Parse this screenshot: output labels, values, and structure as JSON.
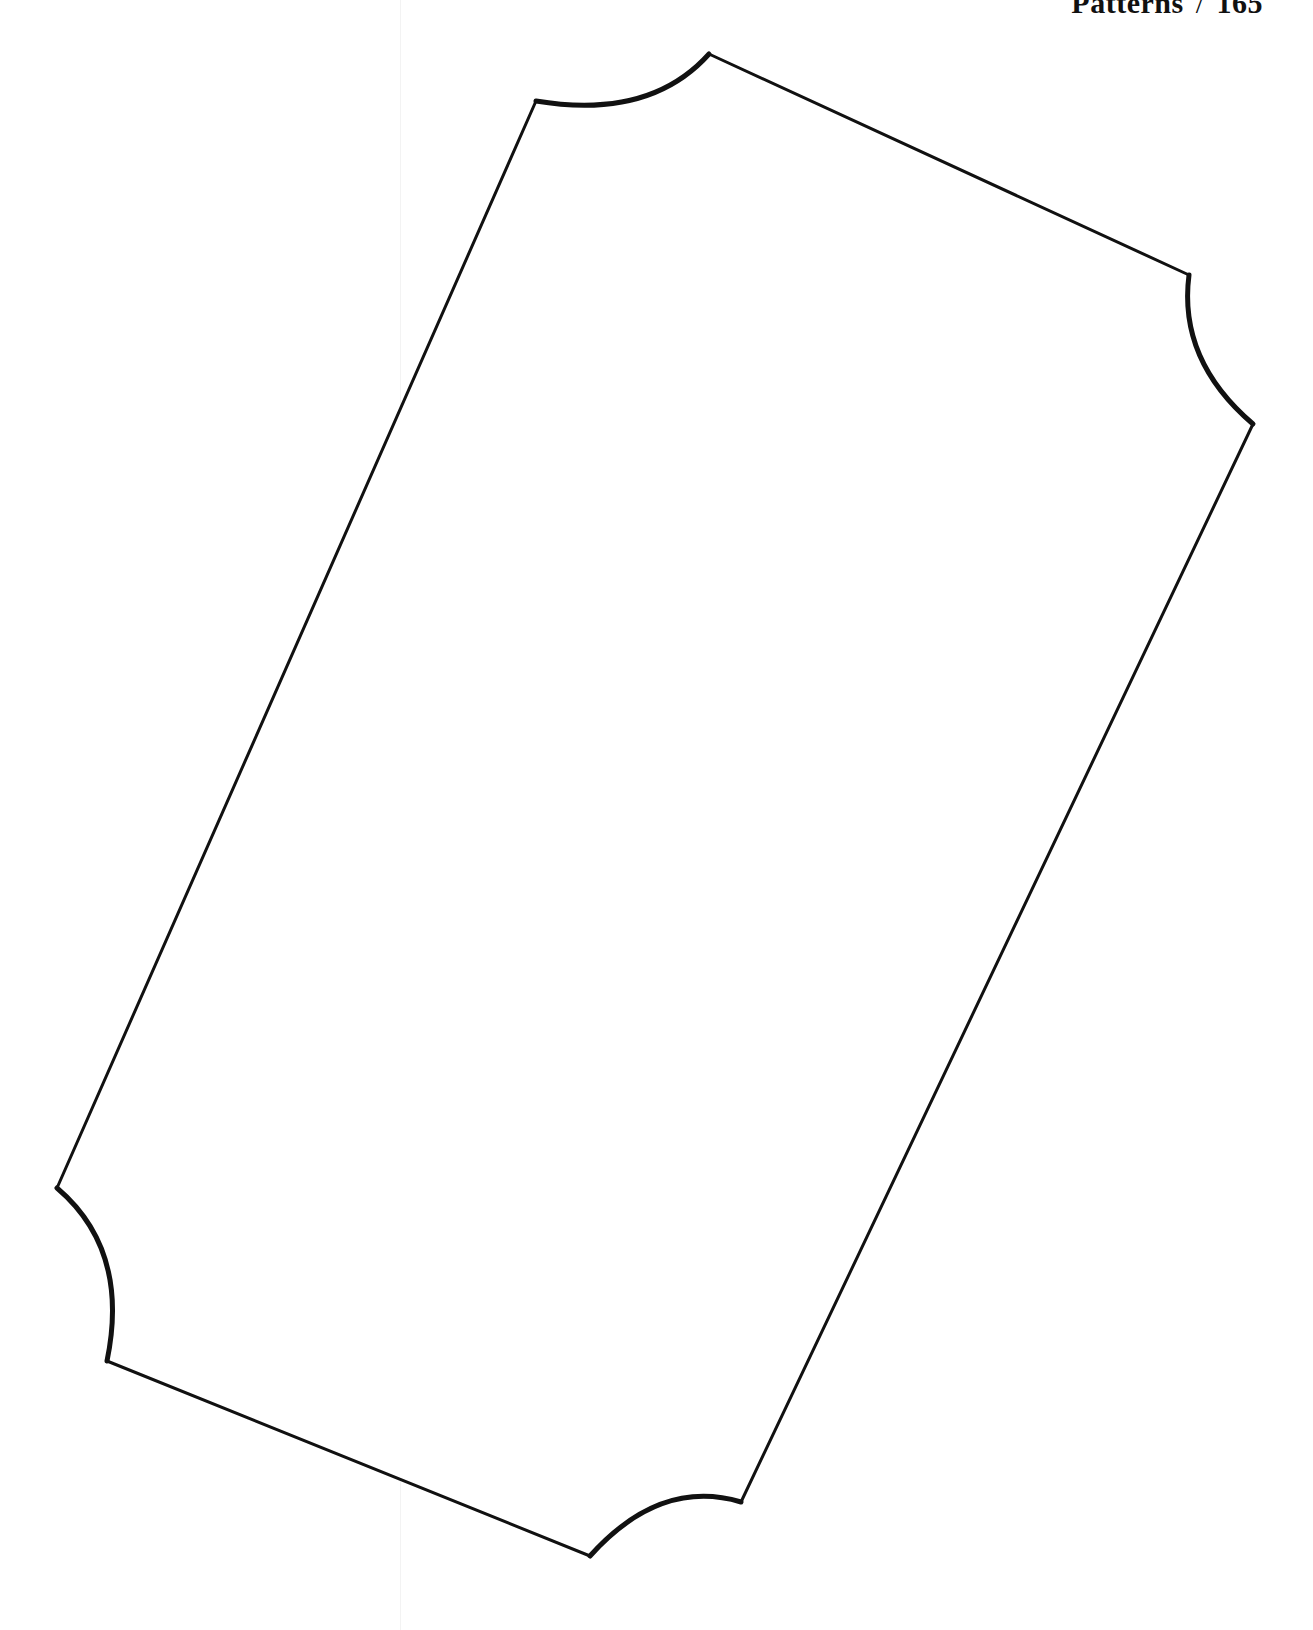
{
  "page": {
    "header": {
      "section": "Patterns",
      "separator": "/",
      "page_number": "165"
    }
  },
  "pattern": {
    "name": "ticket-shape-template",
    "stroke_color": "#111111",
    "fill_color": "#ffffff",
    "corners": "scalloped (concave arcs at all four corners)"
  }
}
